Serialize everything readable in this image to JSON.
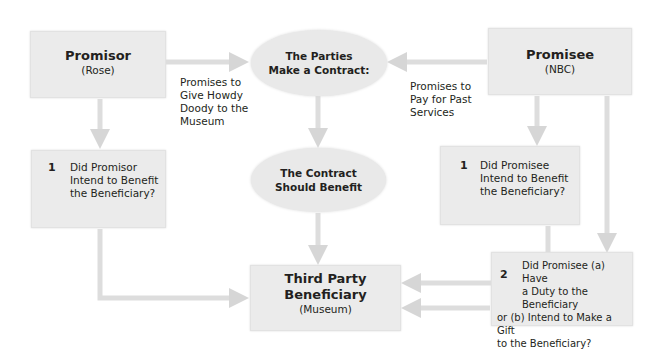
{
  "diagram": {
    "promisor": {
      "title": "Promisor",
      "subtitle": "(Rose)"
    },
    "promisee": {
      "title": "Promisee",
      "subtitle": "(NBC)"
    },
    "parties_contract": {
      "line1": "The Parties",
      "line2": "Make a Contract:"
    },
    "contract_benefit": {
      "line1": "The Contract",
      "line2": "Should Benefit"
    },
    "third_party": {
      "line1": "Third Party",
      "line2": "Beneficiary",
      "subtitle": "(Museum)"
    },
    "promisor_promise": {
      "line1": "Promises to",
      "line2": "Give Howdy",
      "line3": "Doody to the",
      "line4": "Museum"
    },
    "promisee_promise": {
      "line1": "Promises to",
      "line2": "Pay for Past",
      "line3": "Services"
    },
    "promisor_question": {
      "number": "1",
      "line1": "Did Promisor",
      "line2": "Intend to Benefit",
      "line3": "the Beneficiary?"
    },
    "promisee_question1": {
      "number": "1",
      "line1": "Did Promisee",
      "line2": "Intend to Benefit",
      "line3": "the Beneficiary?"
    },
    "promisee_question2": {
      "number": "2",
      "line1": "Did Promisee (a) Have",
      "line2": "a Duty to the Beneficiary",
      "line3": "or (b) Intend to Make a Gift",
      "line4": "to the Beneficiary?"
    },
    "colors": {
      "box_fill": "#ebebeb",
      "connector": "#d9d9d9",
      "text": "#231f20"
    }
  }
}
